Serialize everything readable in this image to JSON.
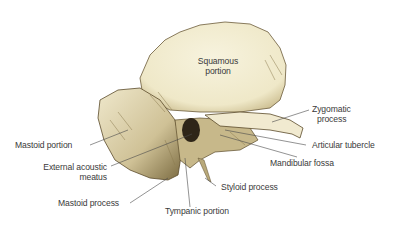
{
  "figure": {
    "colors": {
      "bone_light": "#f4efd6",
      "bone_mid": "#d9cfa6",
      "bone_shadow": "#8a7a4e",
      "bone_dark": "#3e3220",
      "leader_line": "#4a4a4a",
      "label_text": "#3a3a3a",
      "background": "#ffffff"
    },
    "labels": {
      "squamous_1": "Squamous",
      "squamous_2": "portion",
      "zygomatic_1": "Zygomatic",
      "zygomatic_2": "process",
      "articular_tubercle": "Articular tubercle",
      "mandibular_fossa": "Mandibular fossa",
      "mastoid_portion": "Mastoid portion",
      "external_acoustic_1": "External acoustic",
      "external_acoustic_2": "meatus",
      "styloid_process": "Styloid process",
      "mastoid_process": "Mastoid process",
      "tympanic_portion": "Tympanic portion"
    }
  }
}
